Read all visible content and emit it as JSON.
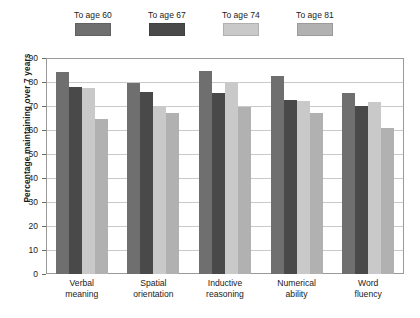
{
  "chart_data": {
    "type": "bar",
    "title": "",
    "subtitle": "",
    "xlabel": "",
    "ylabel": "Percentage maintaining over 7 years",
    "ylim": [
      0,
      90
    ],
    "ytick_step": 10,
    "yticks": [
      90,
      80,
      70,
      60,
      50,
      40,
      30,
      20,
      10,
      0
    ],
    "grid": true,
    "legend_position": "top",
    "categories": [
      "Verbal meaning",
      "Spatial orientation",
      "Inductive reasoning",
      "Numerical ability",
      "Word fluency"
    ],
    "categories_lines": [
      [
        "Verbal",
        "meaning"
      ],
      [
        "Spatial",
        "orientation"
      ],
      [
        "Inductive",
        "reasoning"
      ],
      [
        "Numerical",
        "ability"
      ],
      [
        "Word",
        "fluency"
      ]
    ],
    "series": [
      {
        "name": "To age 60",
        "color": "#6f6f6f",
        "values": [
          84,
          79.5,
          84.5,
          82.5,
          75.5
        ]
      },
      {
        "name": "To age 67",
        "color": "#494949",
        "values": [
          78,
          76,
          75.5,
          72.5,
          70
        ]
      },
      {
        "name": "To age 74",
        "color": "#c9c9c9",
        "values": [
          77.5,
          69.5,
          79.5,
          72,
          71.5
        ]
      },
      {
        "name": "To age 81",
        "color": "#b1b1b1",
        "values": [
          64.5,
          67,
          69.5,
          67,
          61
        ]
      }
    ]
  },
  "colors": {
    "frame": "#9a9a9a",
    "gridline": "#c9c9c9",
    "text": "#1a1a1a",
    "background": "#ffffff"
  }
}
